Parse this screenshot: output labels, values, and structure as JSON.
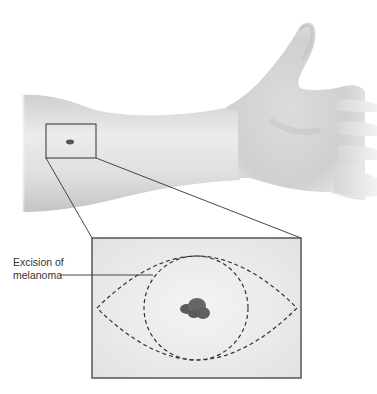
{
  "figure": {
    "annotation": {
      "line1": "Excision of",
      "line2": "melanoma"
    },
    "colors": {
      "skin_light": "#eeeeee",
      "skin_mid": "#d4d4d4",
      "skin_dark": "#b8b8b8",
      "lesion": "#555555",
      "outline": "#444444",
      "dashes": "#333333"
    }
  }
}
